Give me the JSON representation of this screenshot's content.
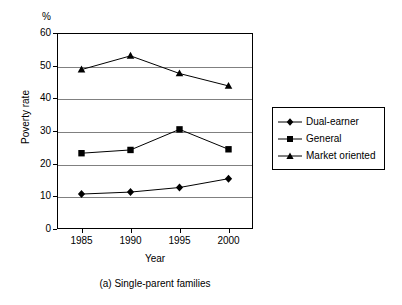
{
  "chart_data": {
    "type": "line",
    "title": "",
    "caption": "(a) Single-parent families",
    "xlabel": "Year",
    "ylabel": "Poverty rate",
    "yunit": "%",
    "categories": [
      "1985",
      "1990",
      "1995",
      "2000"
    ],
    "x": [
      1985,
      1990,
      1995,
      2000
    ],
    "ylim": [
      0,
      60
    ],
    "yticks": [
      0,
      10,
      20,
      30,
      40,
      50,
      60
    ],
    "ytick_labels": [
      "0",
      "10",
      "20",
      "30",
      "40",
      "50",
      "60"
    ],
    "grid": "horizontal",
    "legend_position": "right",
    "series": [
      {
        "name": "Dual-earner",
        "marker": "diamond",
        "values": [
          10.7,
          11.3,
          12.7,
          15.4
        ]
      },
      {
        "name": "General",
        "marker": "square",
        "values": [
          23.2,
          24.2,
          30.5,
          24.4
        ]
      },
      {
        "name": "Market oriented",
        "marker": "triangle",
        "values": [
          48.8,
          53.0,
          47.6,
          43.8
        ]
      }
    ]
  },
  "legend": {
    "items": [
      {
        "label": "Dual-earner",
        "marker": "diamond"
      },
      {
        "label": "General",
        "marker": "square"
      },
      {
        "label": "Market oriented",
        "marker": "triangle"
      }
    ]
  },
  "colors": {
    "axis": "#000000",
    "grid": "#808080",
    "series": "#000000",
    "background": "#ffffff"
  }
}
